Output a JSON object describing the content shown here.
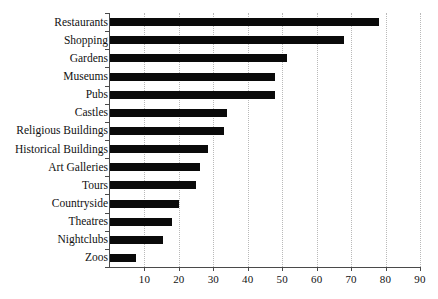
{
  "chart_data": {
    "type": "bar",
    "orientation": "horizontal",
    "title": "",
    "subtitle": "",
    "xlabel": "",
    "ylabel": "",
    "xlim": [
      0,
      90
    ],
    "xticks": [
      10,
      20,
      30,
      40,
      50,
      60,
      70,
      80,
      90
    ],
    "grid": "vertical-dotted",
    "legend": "none",
    "bar_color": "#0a0a0a",
    "grid_color": "#b9b9b9",
    "axis_color": "#4a4a4a",
    "background_color": "#ffffff",
    "categories": [
      "Restaurants",
      "Shopping",
      "Gardens",
      "Museums",
      "Pubs",
      "Castles",
      "Religious Buildings",
      "Historical Buildings",
      "Art Galleries",
      "Tours",
      "Countryside",
      "Theatres",
      "Nightclubs",
      "Zoos"
    ],
    "values": [
      78,
      68,
      51.5,
      48,
      48,
      34,
      33,
      28.5,
      26,
      25,
      20,
      18,
      15.5,
      7.5
    ],
    "series": [
      {
        "name": "",
        "values": [
          78,
          68,
          51.5,
          48,
          48,
          34,
          33,
          28.5,
          26,
          25,
          20,
          18,
          15.5,
          7.5
        ]
      }
    ]
  }
}
